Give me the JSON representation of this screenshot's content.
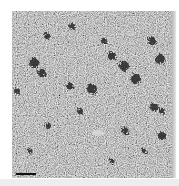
{
  "image": {
    "description": "Grayscale micrograph of granular texture with scattered dark particle clusters",
    "scale_bar": {
      "label": ""
    },
    "colors": {
      "background": "#ffffff",
      "texture_mid": "#9a9a9a",
      "dark_spots": "#1e1e1e",
      "bottom_band": "#ededed"
    }
  }
}
